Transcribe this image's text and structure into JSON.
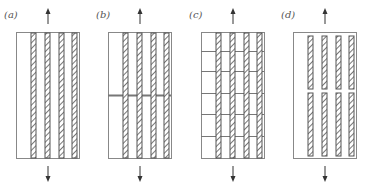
{
  "figure": {
    "panels": [
      {
        "label": "(a)",
        "description": "continuous fibres, intact matrix",
        "x": 16,
        "matrix_cracks": [],
        "fibre_breaks": []
      },
      {
        "label": "(b)",
        "description": "single matrix crack bridged by fibres",
        "x": 108,
        "matrix_cracks": [
          95
        ],
        "fibre_breaks": []
      },
      {
        "label": "(c)",
        "description": "multiple matrix cracking bridged by fibres",
        "x": 201,
        "matrix_cracks": [
          51,
          71,
          93,
          114,
          136
        ],
        "fibre_breaks": []
      },
      {
        "label": "(d)",
        "description": "matrix crack with fibre fracture",
        "x": 293,
        "matrix_cracks": [],
        "fibre_breaks": [
          91
        ]
      }
    ],
    "specimen": {
      "top": 32,
      "bottom": 158,
      "width": 63
    },
    "fibre_offsets": [
      15,
      29,
      43,
      56
    ],
    "fibre_width": 5,
    "arrows": {
      "up": "tension-arrow-up",
      "down": "tension-arrow-down"
    },
    "colors": {
      "outline": "#888888",
      "fibre": "#555555",
      "crack": "#777777",
      "text": "#555555"
    }
  }
}
